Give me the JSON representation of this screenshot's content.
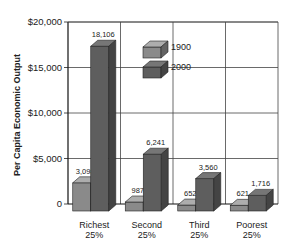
{
  "chart_data": {
    "type": "bar",
    "title": "",
    "xlabel": "",
    "ylabel": "Per Capita Economic Output",
    "ylim": [
      0,
      20000
    ],
    "yticks": [
      0,
      5000,
      10000,
      15000,
      20000
    ],
    "ytick_labels": [
      "0",
      "$5,000",
      "$10,000",
      "$15,000",
      "$20,000"
    ],
    "categories": [
      "Richest 25%",
      "Second 25%",
      "Third 25%",
      "Poorest 25%"
    ],
    "category_lines": [
      [
        "Richest",
        "25%"
      ],
      [
        "Second",
        "25%"
      ],
      [
        "Third",
        "25%"
      ],
      [
        "Poorest",
        "25%"
      ]
    ],
    "series": [
      {
        "name": "1900",
        "values": [
          3098,
          987,
          652,
          621
        ],
        "labels": [
          "3,098",
          "987",
          "652",
          "621"
        ],
        "color": "#8a8a8a"
      },
      {
        "name": "2000",
        "values": [
          18106,
          6241,
          3560,
          1716
        ],
        "labels": [
          "18,106",
          "6,241",
          "3,560",
          "1,716"
        ],
        "color": "#5e5e5e"
      }
    ],
    "grid": true,
    "legend_position": "upper-center-inside",
    "style": "3d-bars"
  }
}
